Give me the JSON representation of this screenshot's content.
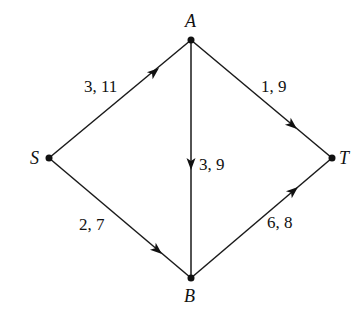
{
  "diagram": {
    "type": "directed-network",
    "nodes": [
      {
        "id": "S",
        "label": "S",
        "x": 49,
        "y": 158
      },
      {
        "id": "A",
        "label": "A",
        "x": 191,
        "y": 40
      },
      {
        "id": "B",
        "label": "B",
        "x": 191,
        "y": 278
      },
      {
        "id": "T",
        "label": "T",
        "x": 332,
        "y": 158
      }
    ],
    "edges": [
      {
        "from": "S",
        "to": "A",
        "label": "3, 11"
      },
      {
        "from": "S",
        "to": "B",
        "label": "2, 7"
      },
      {
        "from": "A",
        "to": "B",
        "label": "3, 9"
      },
      {
        "from": "A",
        "to": "T",
        "label": "1, 9"
      },
      {
        "from": "B",
        "to": "T",
        "label": "6, 8"
      }
    ]
  }
}
